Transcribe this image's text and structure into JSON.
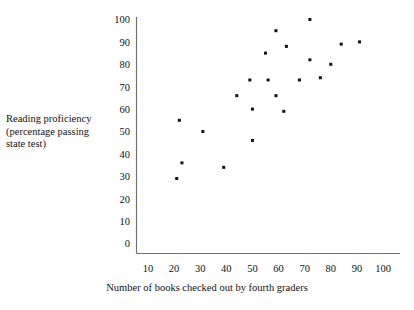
{
  "chart_data": {
    "type": "scatter",
    "title": "",
    "xlabel": "Number of books checked out by fourth graders",
    "ylabel": "Reading proficiency (percentage passing state test)",
    "ylabel_lines": [
      "Reading proficiency",
      "(percentage passing",
      "state test)"
    ],
    "xlim": [
      5,
      105
    ],
    "ylim": [
      0,
      104
    ],
    "xticks": [
      10,
      20,
      30,
      40,
      50,
      60,
      70,
      80,
      90,
      100
    ],
    "yticks": [
      0,
      10,
      20,
      30,
      40,
      50,
      60,
      70,
      80,
      90,
      100
    ],
    "xtick_labels": [
      "10",
      "20",
      "30",
      "40",
      "50",
      "60",
      "70",
      "80",
      "90",
      "100"
    ],
    "ytick_labels": [
      "0",
      "10",
      "20",
      "30",
      "40",
      "50",
      "60",
      "70",
      "80",
      "90",
      "100"
    ],
    "grid": false,
    "legend": null,
    "marker": "square",
    "marker_color": "#111111",
    "axis_color": "#6f6f6f",
    "points": [
      {
        "x": 21,
        "y": 29
      },
      {
        "x": 22,
        "y": 55
      },
      {
        "x": 23,
        "y": 36
      },
      {
        "x": 31,
        "y": 50
      },
      {
        "x": 39,
        "y": 34
      },
      {
        "x": 44,
        "y": 66
      },
      {
        "x": 49,
        "y": 73
      },
      {
        "x": 50,
        "y": 46
      },
      {
        "x": 50,
        "y": 60
      },
      {
        "x": 55,
        "y": 85
      },
      {
        "x": 56,
        "y": 73
      },
      {
        "x": 59,
        "y": 95
      },
      {
        "x": 59,
        "y": 66
      },
      {
        "x": 62,
        "y": 59
      },
      {
        "x": 63,
        "y": 88
      },
      {
        "x": 68,
        "y": 73
      },
      {
        "x": 72,
        "y": 100
      },
      {
        "x": 72,
        "y": 82
      },
      {
        "x": 76,
        "y": 74
      },
      {
        "x": 80,
        "y": 80
      },
      {
        "x": 84,
        "y": 89
      },
      {
        "x": 91,
        "y": 90
      }
    ]
  }
}
